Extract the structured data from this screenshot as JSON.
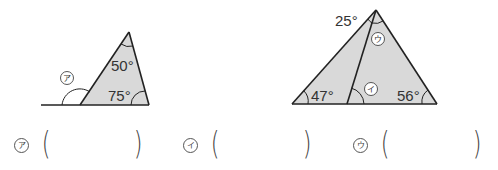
{
  "figure1": {
    "angles": {
      "top": "50°",
      "bottom_right": "75°"
    },
    "unknown_label": "ア"
  },
  "figure2": {
    "angles": {
      "apex_left": "25°",
      "bottom_left": "47°",
      "bottom_right": "56°"
    },
    "unknown_labels": {
      "inner_base": "イ",
      "apex_right": "ウ"
    }
  },
  "answers": [
    {
      "label": "ア",
      "open": "(",
      "close": ")",
      "value": ""
    },
    {
      "label": "イ",
      "open": "(",
      "close": ")",
      "value": ""
    },
    {
      "label": "ウ",
      "open": "(",
      "close": ")",
      "value": ""
    }
  ],
  "colors": {
    "fill": "#d9d9d9",
    "stroke": "#222222"
  }
}
